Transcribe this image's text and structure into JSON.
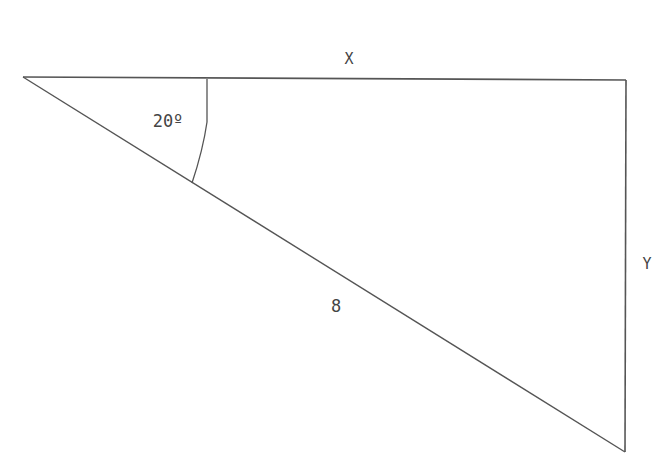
{
  "diagram": {
    "type": "right-triangle",
    "stroke_color": "#555555",
    "label_color": "#444444",
    "vertices": {
      "left": [
        23,
        77
      ],
      "top_right": [
        626,
        80
      ],
      "bottom_right": [
        625,
        452
      ]
    },
    "labels": {
      "top_side": "X",
      "right_side": "Y",
      "hypotenuse": "8",
      "angle": "20º"
    }
  }
}
